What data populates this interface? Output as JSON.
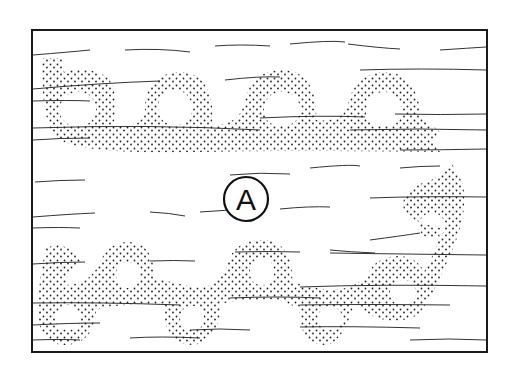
{
  "figure": {
    "label": "A",
    "colors": {
      "ink": "#1a1a1a",
      "background": "#ffffff"
    },
    "frame": {
      "x": 32,
      "y": 30,
      "width": 455,
      "height": 322
    },
    "top_chain": {
      "loops": [
        {
          "cx": 78,
          "cy": 110,
          "r": 32
        },
        {
          "cx": 175,
          "cy": 108,
          "r": 36
        },
        {
          "cx": 280,
          "cy": 108,
          "r": 38
        },
        {
          "cx": 382,
          "cy": 112,
          "r": 38
        }
      ]
    },
    "bottom_chain": {
      "loops": [
        {
          "cx": 68,
          "cy": 318,
          "r": 30
        },
        {
          "cx": 128,
          "cy": 275,
          "r": 30
        },
        {
          "cx": 192,
          "cy": 318,
          "r": 30
        },
        {
          "cx": 262,
          "cy": 272,
          "r": 32
        },
        {
          "cx": 330,
          "cy": 318,
          "r": 30
        },
        {
          "cx": 403,
          "cy": 292,
          "r": 33
        },
        {
          "cx": 432,
          "cy": 226,
          "r": 33
        }
      ]
    }
  }
}
